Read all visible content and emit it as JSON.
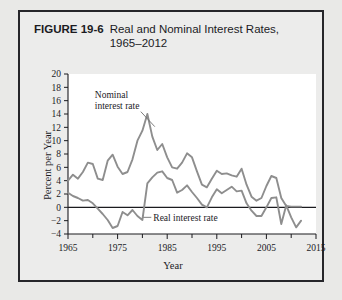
{
  "figure": {
    "number": "FIGURE 19-6",
    "title_line1": "Real and Nominal Interest Rates,",
    "title_line2": "1965–2012"
  },
  "chart_data": {
    "type": "line",
    "title": "Real and Nominal Interest Rates, 1965–2012",
    "xlabel": "Year",
    "ylabel": "Percent per Year",
    "xlim": [
      1965,
      2015
    ],
    "ylim": [
      -4,
      20
    ],
    "xticks": [
      1965,
      1975,
      1985,
      1995,
      2005,
      2015
    ],
    "xticks_minor": [
      1970,
      1980,
      1990,
      2000,
      2010
    ],
    "yticks": [
      -4,
      -2,
      0,
      2,
      4,
      6,
      8,
      10,
      12,
      14,
      16,
      18,
      20
    ],
    "grid": false,
    "legend_position": "inline-annotations",
    "zero_reference_line": 0,
    "line_color": "#8e8e8e",
    "annotations": [
      {
        "text": "Nominal interest rate",
        "x": 1970,
        "y": 16
      },
      {
        "text": "Real interest rate",
        "x": 1982,
        "y": -1.5
      }
    ],
    "x": [
      1965,
      1966,
      1967,
      1968,
      1969,
      1970,
      1971,
      1972,
      1973,
      1974,
      1975,
      1976,
      1977,
      1978,
      1979,
      1980,
      1981,
      1982,
      1983,
      1984,
      1985,
      1986,
      1987,
      1988,
      1989,
      1990,
      1991,
      1992,
      1993,
      1994,
      1995,
      1996,
      1997,
      1998,
      1999,
      2000,
      2001,
      2002,
      2003,
      2004,
      2005,
      2006,
      2007,
      2008,
      2009,
      2010,
      2011,
      2012
    ],
    "series": [
      {
        "name": "Nominal interest rate",
        "values": [
          4.0,
          4.9,
          4.3,
          5.3,
          6.7,
          6.5,
          4.3,
          4.1,
          7.0,
          7.9,
          6.1,
          5.0,
          5.3,
          7.2,
          10.0,
          11.5,
          14.0,
          10.6,
          8.6,
          9.5,
          7.5,
          6.0,
          5.8,
          6.7,
          8.1,
          7.5,
          5.4,
          3.4,
          3.0,
          4.3,
          5.5,
          5.0,
          5.1,
          4.8,
          4.6,
          5.8,
          3.4,
          1.6,
          1.0,
          1.4,
          3.2,
          4.7,
          4.4,
          1.4,
          0.2,
          0.1,
          0.1,
          0.1
        ]
      },
      {
        "name": "Real interest rate",
        "values": [
          2.2,
          1.7,
          1.4,
          1.0,
          1.1,
          0.6,
          -0.2,
          -1.0,
          -1.9,
          -3.1,
          -2.8,
          -0.7,
          -1.2,
          -0.4,
          -1.3,
          -1.9,
          3.6,
          4.5,
          5.2,
          5.4,
          4.4,
          4.1,
          2.2,
          2.6,
          3.3,
          2.3,
          1.4,
          0.4,
          0.0,
          1.5,
          2.7,
          2.1,
          2.6,
          3.1,
          2.4,
          2.5,
          0.6,
          -0.5,
          -1.3,
          -1.3,
          0.0,
          1.4,
          1.5,
          -2.5,
          0.3,
          -1.5,
          -3.0,
          -2.0
        ]
      }
    ]
  }
}
